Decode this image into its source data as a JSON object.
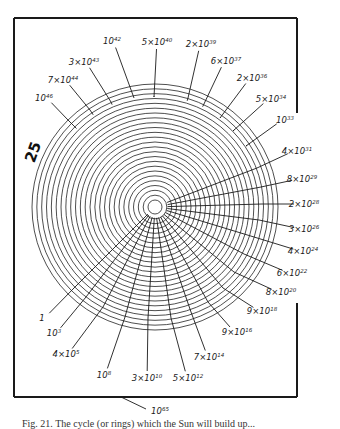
{
  "figure": {
    "side_number": "25",
    "bottom_label": {
      "base": "10",
      "exp": "65"
    },
    "caption": "Fig. 21. The cycle (or rings) which the Sun will build up..."
  },
  "geometry": {
    "center": [
      155,
      207
    ],
    "outer_radius": 123,
    "ring_count": 25,
    "frame": {
      "left": 14,
      "top": 18,
      "right": 297,
      "bottom": 397,
      "right_gap": [
        113,
        303
      ]
    }
  },
  "labels": [
    {
      "id": "l1",
      "coef": "",
      "base": "1",
      "exp": "",
      "x": 42,
      "y": 318,
      "lx": 74,
      "ly": 288
    },
    {
      "id": "l2",
      "coef": "",
      "base": "10",
      "exp": "3",
      "x": 54,
      "y": 333,
      "lx": 86,
      "ly": 297
    },
    {
      "id": "l3",
      "coef": "4×",
      "base": "10",
      "exp": "5",
      "x": 66,
      "y": 354,
      "lx": 103,
      "ly": 307
    },
    {
      "id": "l4",
      "coef": "",
      "base": "10",
      "exp": "8",
      "x": 104,
      "y": 375,
      "lx": 125,
      "ly": 317
    },
    {
      "id": "l5",
      "coef": "3×",
      "base": "10",
      "exp": "10",
      "x": 147,
      "y": 378,
      "lx": 148,
      "ly": 318
    },
    {
      "id": "l6",
      "coef": "5×",
      "base": "10",
      "exp": "12",
      "x": 188,
      "y": 378,
      "lx": 171,
      "ly": 318
    },
    {
      "id": "l7",
      "coef": "7×",
      "base": "10",
      "exp": "14",
      "x": 209,
      "y": 357,
      "lx": 191,
      "ly": 312
    },
    {
      "id": "l8",
      "coef": "9×",
      "base": "10",
      "exp": "16",
      "x": 237,
      "y": 332,
      "lx": 208,
      "ly": 302
    },
    {
      "id": "l9",
      "coef": "9×",
      "base": "10",
      "exp": "18",
      "x": 262,
      "y": 311,
      "lx": 223,
      "ly": 288
    },
    {
      "id": "l10",
      "coef": "8×",
      "base": "10",
      "exp": "20",
      "x": 281,
      "y": 292,
      "lx": 234,
      "ly": 272
    },
    {
      "id": "l11",
      "coef": "6×",
      "base": "10",
      "exp": "22",
      "x": 292,
      "y": 273,
      "lx": 244,
      "ly": 254
    },
    {
      "id": "l12",
      "coef": "4×",
      "base": "10",
      "exp": "24",
      "x": 303,
      "y": 251,
      "lx": 254,
      "ly": 237
    },
    {
      "id": "l13",
      "coef": "3×",
      "base": "10",
      "exp": "26",
      "x": 304,
      "y": 229,
      "lx": 259,
      "ly": 220
    },
    {
      "id": "l14",
      "coef": "2×",
      "base": "10",
      "exp": "28",
      "x": 304,
      "y": 204,
      "lx": 262,
      "ly": 204
    },
    {
      "id": "l15",
      "coef": "8×",
      "base": "10",
      "exp": "29",
      "x": 302,
      "y": 179,
      "lx": 261,
      "ly": 187
    },
    {
      "id": "l16",
      "coef": "4×",
      "base": "10",
      "exp": "31",
      "x": 297,
      "y": 151,
      "lx": 257,
      "ly": 168
    },
    {
      "id": "l17",
      "coef": "",
      "base": "10",
      "exp": "33",
      "x": 285,
      "y": 120,
      "lx": 246,
      "ly": 146
    },
    {
      "id": "l18",
      "coef": "5×",
      "base": "10",
      "exp": "34",
      "x": 271,
      "y": 99,
      "lx": 233,
      "ly": 131
    },
    {
      "id": "l19",
      "coef": "2×",
      "base": "10",
      "exp": "36",
      "x": 252,
      "y": 78,
      "lx": 220,
      "ly": 118
    },
    {
      "id": "l20",
      "coef": "6×",
      "base": "10",
      "exp": "37",
      "x": 226,
      "y": 61,
      "lx": 203,
      "ly": 106
    },
    {
      "id": "l21",
      "coef": "2×",
      "base": "10",
      "exp": "39",
      "x": 201,
      "y": 44,
      "lx": 188,
      "ly": 98
    },
    {
      "id": "l22",
      "coef": "5×",
      "base": "10",
      "exp": "40",
      "x": 157,
      "y": 42,
      "lx": 154,
      "ly": 97
    },
    {
      "id": "l23",
      "coef": "",
      "base": "10",
      "exp": "42",
      "x": 112,
      "y": 41,
      "lx": 134,
      "ly": 98
    },
    {
      "id": "l24",
      "coef": "3×",
      "base": "10",
      "exp": "43",
      "x": 84,
      "y": 62,
      "lx": 111,
      "ly": 102
    },
    {
      "id": "l25",
      "coef": "7×",
      "base": "10",
      "exp": "44",
      "x": 63,
      "y": 80,
      "lx": 90,
      "ly": 110
    },
    {
      "id": "l26",
      "coef": "",
      "base": "10",
      "exp": "46",
      "x": 44,
      "y": 98,
      "lx": 68,
      "ly": 120
    }
  ]
}
